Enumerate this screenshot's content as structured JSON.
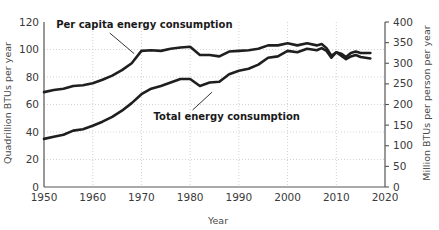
{
  "chart_data": {
    "type": "line",
    "title": "",
    "xlabel": "Year",
    "ylabel": "Quadrillion BTUs per year",
    "y2label": "Million BTUs per person per year",
    "xlim": [
      1950,
      2020
    ],
    "ylim": [
      0,
      120
    ],
    "y2lim": [
      0,
      400
    ],
    "grid": true,
    "legend_position": "inline-annotations",
    "xticks": [
      "1950",
      "1960",
      "1970",
      "1980",
      "1990",
      "2000",
      "2010",
      "2020"
    ],
    "xtick_values": [
      1950,
      1960,
      1970,
      1980,
      1990,
      2000,
      2010,
      2020
    ],
    "yticks": [
      "0",
      "20",
      "40",
      "60",
      "80",
      "100",
      "120"
    ],
    "ytick_values": [
      0,
      20,
      40,
      60,
      80,
      100,
      120
    ],
    "y2ticks": [
      "0",
      "50",
      "100",
      "150",
      "200",
      "250",
      "300",
      "350",
      "400"
    ],
    "y2tick_values": [
      0,
      50,
      100,
      150,
      200,
      250,
      300,
      350,
      400
    ],
    "annotations": [
      {
        "text": "Per capita energy consumption",
        "x": 1952.5,
        "y": 118,
        "leader_from": [
          1963.5,
          112
        ],
        "leader_to": [
          1968.5,
          97
        ]
      },
      {
        "text": "Total energy consumption",
        "x": 1972.5,
        "y": 51,
        "leader_from": [
          1980.5,
          56
        ],
        "leader_to": [
          1984.5,
          69
        ]
      }
    ],
    "series": [
      {
        "name": "Per capita energy consumption",
        "axis": "right",
        "units": "Million BTUs per person per year",
        "x": [
          1950,
          1952,
          1954,
          1956,
          1958,
          1960,
          1962,
          1964,
          1966,
          1968,
          1970,
          1972,
          1974,
          1976,
          1978,
          1980,
          1982,
          1984,
          1986,
          1988,
          1990,
          1992,
          1994,
          1996,
          1998,
          2000,
          2002,
          2004,
          2006,
          2007,
          2008,
          2009,
          2010,
          2011,
          2012,
          2013,
          2014,
          2015,
          2016,
          2017
        ],
        "values_left_scale": [
          69,
          70.5,
          71.5,
          73.5,
          74,
          75.5,
          78,
          81,
          85,
          90,
          99,
          99.5,
          99,
          100.5,
          101.5,
          102,
          96,
          96,
          95,
          98.5,
          99,
          99.5,
          100.5,
          103,
          103,
          104.5,
          103,
          104.5,
          103,
          104,
          101,
          95.5,
          98,
          95.5,
          93,
          95,
          96,
          94.5,
          94,
          93.5
        ],
        "values": [
          230,
          235,
          238,
          245,
          247,
          252,
          260,
          270,
          283,
          300,
          330,
          332,
          330,
          335,
          338,
          340,
          320,
          320,
          317,
          328,
          330,
          332,
          335,
          343,
          343,
          348,
          343,
          348,
          343,
          347,
          337,
          318,
          327,
          318,
          310,
          317,
          320,
          315,
          313,
          312
        ]
      },
      {
        "name": "Total energy consumption",
        "axis": "left",
        "units": "Quadrillion BTUs per year",
        "x": [
          1950,
          1952,
          1954,
          1956,
          1958,
          1960,
          1962,
          1964,
          1966,
          1968,
          1970,
          1972,
          1974,
          1976,
          1978,
          1980,
          1982,
          1984,
          1986,
          1988,
          1990,
          1992,
          1994,
          1996,
          1998,
          2000,
          2002,
          2004,
          2006,
          2007,
          2008,
          2009,
          2010,
          2011,
          2012,
          2013,
          2014,
          2015,
          2016,
          2017
        ],
        "values": [
          35,
          36.5,
          38,
          41,
          42,
          44.5,
          47.5,
          51,
          55.5,
          61,
          67.5,
          71.5,
          73.5,
          76,
          78.5,
          78.5,
          73.5,
          76,
          76.5,
          82,
          84.5,
          86,
          89,
          94,
          95,
          99,
          98,
          100.5,
          99.5,
          101,
          99,
          94,
          98,
          97,
          94.5,
          97.5,
          98.5,
          97.5,
          97.5,
          97.5
        ]
      }
    ]
  }
}
